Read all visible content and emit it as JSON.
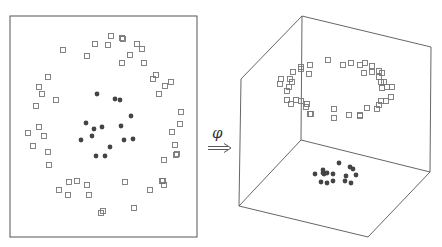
{
  "mapping": {
    "label": "φ",
    "arrow": "double-right-arrow"
  },
  "colors": {
    "line": "#555555",
    "square": "#777777",
    "dot": "#444444",
    "background": "#ffffff"
  },
  "left_panel": {
    "box": [
      10,
      16,
      197,
      237
    ],
    "squares": [
      [
        111,
        36
      ],
      [
        122,
        38
      ],
      [
        123,
        39
      ],
      [
        95,
        44
      ],
      [
        108,
        45
      ],
      [
        137,
        44
      ],
      [
        142,
        49
      ],
      [
        63,
        50
      ],
      [
        87,
        56
      ],
      [
        130,
        55
      ],
      [
        122,
        63
      ],
      [
        144,
        63
      ],
      [
        156,
        75
      ],
      [
        153,
        79
      ],
      [
        48,
        77
      ],
      [
        171,
        82
      ],
      [
        165,
        86
      ],
      [
        39,
        87
      ],
      [
        42,
        94
      ],
      [
        159,
        94
      ],
      [
        56,
        100
      ],
      [
        36,
        106
      ],
      [
        181,
        112
      ],
      [
        180,
        124
      ],
      [
        39,
        127
      ],
      [
        28,
        133
      ],
      [
        44,
        136
      ],
      [
        172,
        132
      ],
      [
        33,
        146
      ],
      [
        175,
        145
      ],
      [
        48,
        152
      ],
      [
        177,
        154
      ],
      [
        176,
        155
      ],
      [
        164,
        160
      ],
      [
        49,
        165
      ],
      [
        69,
        182
      ],
      [
        77,
        181
      ],
      [
        87,
        185
      ],
      [
        125,
        182
      ],
      [
        163,
        181
      ],
      [
        162,
        181
      ],
      [
        164,
        185
      ],
      [
        59,
        190
      ],
      [
        68,
        195
      ],
      [
        89,
        195
      ],
      [
        150,
        190
      ],
      [
        103,
        211
      ],
      [
        101,
        213
      ],
      [
        134,
        208
      ]
    ],
    "dots": [
      [
        97,
        94
      ],
      [
        115,
        99
      ],
      [
        120,
        100
      ],
      [
        131,
        116
      ],
      [
        86,
        123
      ],
      [
        102,
        127
      ],
      [
        94,
        129
      ],
      [
        121,
        126
      ],
      [
        92,
        136
      ],
      [
        81,
        140
      ],
      [
        124,
        140
      ],
      [
        133,
        139
      ],
      [
        110,
        147
      ],
      [
        96,
        156
      ],
      [
        105,
        156
      ]
    ]
  },
  "right_panel": {
    "cube": {
      "back_top_left": [
        302,
        16
      ],
      "back_top_right": [
        431,
        47
      ],
      "back_bottom_left": [
        301,
        140
      ],
      "back_bottom_right": [
        430,
        172
      ],
      "front_top_left": [
        241,
        79
      ],
      "front_bottom_left": [
        239,
        206
      ],
      "front_bottom_right": [
        368,
        237
      ]
    },
    "squares": [
      [
        328,
        60
      ],
      [
        343,
        65
      ],
      [
        351,
        63
      ],
      [
        360,
        65
      ],
      [
        365,
        63
      ],
      [
        372,
        66
      ],
      [
        301,
        67
      ],
      [
        301,
        69
      ],
      [
        310,
        65
      ],
      [
        293,
        72
      ],
      [
        309,
        74
      ],
      [
        364,
        73
      ],
      [
        372,
        72
      ],
      [
        379,
        71
      ],
      [
        382,
        73
      ],
      [
        379,
        77
      ],
      [
        281,
        79
      ],
      [
        290,
        79
      ],
      [
        280,
        84
      ],
      [
        292,
        82
      ],
      [
        381,
        82
      ],
      [
        384,
        82
      ],
      [
        382,
        88
      ],
      [
        387,
        87
      ],
      [
        392,
        87
      ],
      [
        289,
        87
      ],
      [
        287,
        91
      ],
      [
        391,
        97
      ],
      [
        287,
        100
      ],
      [
        291,
        104
      ],
      [
        296,
        100
      ],
      [
        301,
        101
      ],
      [
        307,
        104
      ],
      [
        306,
        107
      ],
      [
        381,
        101
      ],
      [
        386,
        101
      ],
      [
        379,
        105
      ],
      [
        377,
        109
      ],
      [
        367,
        108
      ],
      [
        334,
        109
      ],
      [
        310,
        114
      ],
      [
        311,
        114
      ],
      [
        334,
        118
      ],
      [
        349,
        115
      ],
      [
        360,
        115
      ],
      [
        360,
        116
      ]
    ],
    "dots": [
      [
        339,
        163
      ],
      [
        350,
        167
      ],
      [
        353,
        169
      ],
      [
        315,
        174
      ],
      [
        323,
        170
      ],
      [
        324,
        174
      ],
      [
        327,
        173
      ],
      [
        333,
        174
      ],
      [
        346,
        176
      ],
      [
        356,
        175
      ],
      [
        321,
        182
      ],
      [
        327,
        183
      ],
      [
        333,
        181
      ],
      [
        345,
        181
      ],
      [
        351,
        183
      ],
      [
        323,
        173
      ]
    ]
  }
}
